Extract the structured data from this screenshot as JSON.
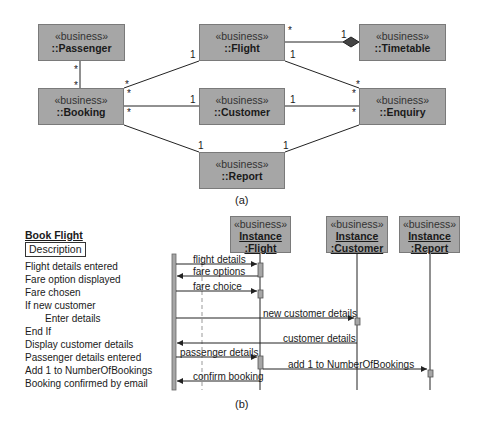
{
  "class_diagram": {
    "caption": "(a)",
    "classes": [
      {
        "id": "passenger",
        "stereotype": "«business»",
        "name": "::Passenger"
      },
      {
        "id": "flight",
        "stereotype": "«business»",
        "name": "::Flight"
      },
      {
        "id": "timetable",
        "stereotype": "«business»",
        "name": "::Timetable"
      },
      {
        "id": "booking",
        "stereotype": "«business»",
        "name": "::Booking"
      },
      {
        "id": "customer",
        "stereotype": "«business»",
        "name": "::Customer"
      },
      {
        "id": "enquiry",
        "stereotype": "«business»",
        "name": "::Enquiry"
      },
      {
        "id": "report",
        "stereotype": "«business»",
        "name": "::Report"
      }
    ],
    "associations": [
      {
        "from": "passenger",
        "to": "booking",
        "from_mult": "*",
        "to_mult": "*"
      },
      {
        "from": "booking",
        "to": "flight",
        "from_mult": "*",
        "to_mult": "1"
      },
      {
        "from": "booking",
        "to": "customer",
        "from_mult": "*",
        "to_mult": "1"
      },
      {
        "from": "booking",
        "to": "report",
        "from_mult": "*",
        "to_mult": "1"
      },
      {
        "from": "flight",
        "to": "timetable",
        "from_mult": "*",
        "to_mult": "1",
        "kind": "composition"
      },
      {
        "from": "flight",
        "to": "enquiry",
        "from_mult": "1",
        "to_mult": "*"
      },
      {
        "from": "customer",
        "to": "enquiry",
        "from_mult": "1",
        "to_mult": "*"
      },
      {
        "from": "report",
        "to": "enquiry",
        "from_mult": "1",
        "to_mult": "*"
      }
    ],
    "multiplicities": {
      "passenger_booking_top": "*",
      "passenger_booking_bottom": "*",
      "booking_flight_booking": "*",
      "booking_flight_flight": "1",
      "booking_customer_booking": "*",
      "booking_customer_customer": "1",
      "booking_report_booking": "*",
      "booking_report_report": "1",
      "flight_timetable_flight": "*",
      "flight_timetable_timetable": "1",
      "flight_enquiry_flight": "1",
      "flight_enquiry_enquiry": "*",
      "customer_enquiry_customer": "1",
      "customer_enquiry_enquiry": "*",
      "report_enquiry_report": "1",
      "report_enquiry_enquiry": "*"
    }
  },
  "sequence_diagram": {
    "caption": "(b)",
    "title": "Book Flight",
    "description_label": "Description",
    "steps": [
      "Flight details entered",
      "Fare option displayed",
      "Fare chosen",
      "If new customer",
      "Enter details",
      "End If",
      "Display customer details",
      "Passenger details entered",
      "Add 1 to NumberOfBookings",
      "Booking confirmed by email"
    ],
    "instances": [
      {
        "id": "flight",
        "stereotype": "«business»",
        "instance": "Instance",
        "class": ":Flight"
      },
      {
        "id": "customer",
        "stereotype": "«business»",
        "instance": "Instance",
        "class": ":Customer"
      },
      {
        "id": "report",
        "stereotype": "«business»",
        "instance": "Instance",
        "class": ":Report"
      }
    ],
    "messages": [
      {
        "label": "flight details",
        "from": "actor",
        "to": "flight"
      },
      {
        "label": "fare options",
        "from": "flight",
        "to": "actor"
      },
      {
        "label": "fare choice",
        "from": "actor",
        "to": "flight"
      },
      {
        "label": "new customer details",
        "from": "actor",
        "to": "customer"
      },
      {
        "label": "customer details",
        "from": "customer",
        "to": "actor"
      },
      {
        "label": "passenger details",
        "from": "actor",
        "to": "flight"
      },
      {
        "label": "add 1 to NumberOfBookings",
        "from": "flight",
        "to": "report"
      },
      {
        "label": "confirm booking",
        "from": "flight",
        "to": "actor"
      }
    ]
  },
  "colors": {
    "box_fill": "#a6a6a6",
    "box_border": "#7a7a7a",
    "line": "#222222"
  }
}
